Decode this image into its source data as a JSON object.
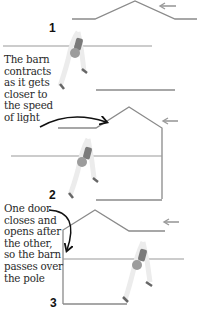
{
  "panels": [
    {
      "number": "1"
    },
    {
      "number": "2"
    },
    {
      "number": "3"
    }
  ],
  "captions": {
    "contracts": "The barn\ncontracts\nas it gets\ncloser to\nthe speed\nof light",
    "doors": "One door\ncloses and\nopens after\nthe other,\nso the barn\npasses over\nthe pole"
  },
  "icons": {
    "motion_arrow": "left-arrow",
    "annotation_arrow": "curved-arrow"
  },
  "colors": {
    "barn_line": "#8a8a8a",
    "pole_line": "#9a9a9a",
    "arrow_gray": "#9a9a9a",
    "annotation_arrow": "#111111",
    "runner_shirt": "#7a7a7a",
    "runner_shorts": "#9c9c9c",
    "text": "#2a2a2a"
  }
}
